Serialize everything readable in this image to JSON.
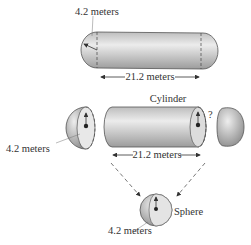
{
  "top": {
    "radius_label": "4.2 meters",
    "length_label": "21.2 meters"
  },
  "middle": {
    "cylinder_label": "Cylinder",
    "hemisphere_radius_label": "4.2 meters",
    "length_label": "21.2 meters",
    "question_mark": "?"
  },
  "bottom": {
    "sphere_label": "Sphere",
    "radius_label": "4.2 meters"
  },
  "colors": {
    "shape_fill_light": "#e6e6e6",
    "shape_fill_dark": "#a8a8a8",
    "outline": "#555555",
    "text": "#333333"
  }
}
